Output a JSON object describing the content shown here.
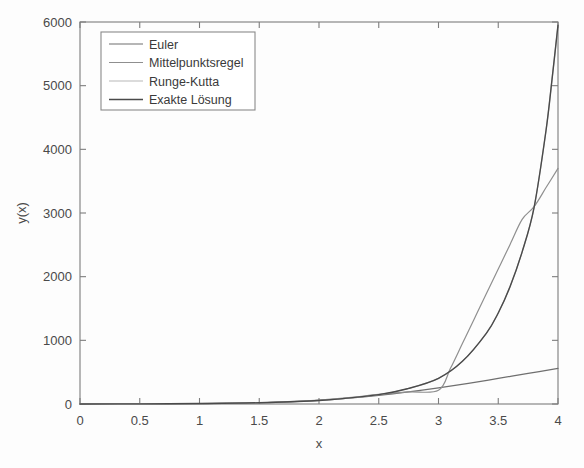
{
  "chart_data": {
    "type": "line",
    "title": "",
    "xlabel": "x",
    "ylabel": "y(x)",
    "xlim": [
      0,
      4
    ],
    "ylim": [
      0,
      6000
    ],
    "xticks": [
      "0",
      "0.5",
      "1",
      "1.5",
      "2",
      "2.5",
      "3",
      "3.5",
      "4"
    ],
    "xtick_values": [
      0,
      0.5,
      1,
      1.5,
      2,
      2.5,
      3,
      3.5,
      4
    ],
    "yticks": [
      "0",
      "1000",
      "2000",
      "3000",
      "4000",
      "5000",
      "6000"
    ],
    "ytick_values": [
      0,
      1000,
      2000,
      3000,
      4000,
      5000,
      6000
    ],
    "grid": false,
    "legend_position": "upper left",
    "series": [
      {
        "name": "Euler",
        "color": "#6f6f6f",
        "width": 1.2,
        "x": [
          0,
          0.25,
          0.5,
          0.75,
          1,
          1.25,
          1.5,
          1.75,
          2,
          2.25,
          2.5,
          2.75,
          3,
          3.25,
          3.5,
          3.75,
          4
        ],
        "values": [
          1,
          1.6,
          2.5,
          4.1,
          6.8,
          11.5,
          19.6,
          33.6,
          57.5,
          92,
          136,
          190,
          252,
          323,
          402,
          480,
          560
        ]
      },
      {
        "name": "Mittelpunktsregel",
        "color": "#8f8f8f",
        "width": 1.2,
        "x": [
          0,
          0.5,
          1,
          1.5,
          2,
          2.25,
          2.5,
          2.75,
          3,
          3.1,
          3.2,
          3.3,
          3.4,
          3.5,
          3.6,
          3.7,
          3.8,
          3.9,
          4
        ],
        "values": [
          1,
          2.4,
          6.5,
          20,
          62,
          100,
          150,
          190,
          215,
          560,
          950,
          1340,
          1730,
          2120,
          2510,
          2900,
          3100,
          3400,
          3700
        ]
      },
      {
        "name": "Runge-Kutta",
        "color": "#b8b8b8",
        "width": 1.2,
        "x": [
          0,
          0.5,
          1,
          1.5,
          2,
          2.5,
          2.75,
          3,
          3.2,
          3.4,
          3.5,
          3.6,
          3.7,
          3.8,
          3.9,
          3.95,
          4
        ],
        "values": [
          1,
          2.7,
          7.4,
          20,
          55,
          148,
          245,
          403,
          670,
          1110,
          1430,
          1850,
          2390,
          3090,
          4300,
          5100,
          5950
        ]
      },
      {
        "name": "Exakte Lösung",
        "color": "#4a4a4a",
        "width": 1.4,
        "x": [
          0,
          0.5,
          1,
          1.5,
          2,
          2.5,
          2.75,
          3,
          3.2,
          3.4,
          3.5,
          3.6,
          3.7,
          3.8,
          3.9,
          3.95,
          4
        ],
        "values": [
          1,
          2.7,
          7.4,
          20,
          55,
          148,
          245,
          403,
          670,
          1110,
          1430,
          1850,
          2390,
          3090,
          4300,
          5100,
          5950
        ]
      }
    ]
  },
  "legend": {
    "entries": [
      {
        "label": "Euler"
      },
      {
        "label": "Mittelpunktsregel"
      },
      {
        "label": "Runge-Kutta"
      },
      {
        "label": "Exakte Lösung"
      }
    ]
  }
}
